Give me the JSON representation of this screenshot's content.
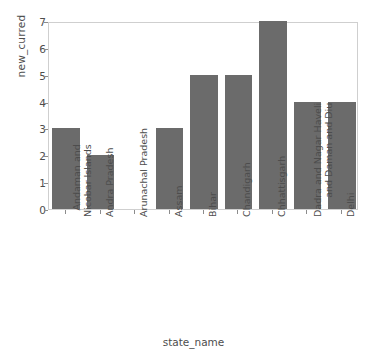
{
  "chart_data": {
    "type": "bar",
    "title": "",
    "subtitle": "",
    "xlabel": "state_name",
    "ylabel": "new_curred",
    "categories": [
      "Andaman and\nNicobar Islands",
      "Andra Pradesh",
      "Arunachal Pradesh",
      "Assam",
      "Bihar",
      "Chandigarh",
      "Chhattisgarh",
      "Dadra and Nagar Haveli\nand Daman and Diu",
      "Delhi"
    ],
    "values": [
      3,
      2,
      0,
      3,
      5,
      5,
      7,
      4,
      4
    ],
    "ylim": [
      0,
      7
    ],
    "yticks": [
      0,
      1,
      2,
      3,
      4,
      5,
      6,
      7
    ],
    "ytick_labels": [
      "0",
      "1",
      "2",
      "3",
      "4",
      "5",
      "6",
      "7"
    ],
    "grid": false,
    "legend": null,
    "bar_color": "#6b6b6b",
    "background_color": "#ffffff",
    "axes_border_color": "#cfcfcf",
    "tick_color": "#8c8c8c",
    "text_color": "#4d4d4d"
  }
}
